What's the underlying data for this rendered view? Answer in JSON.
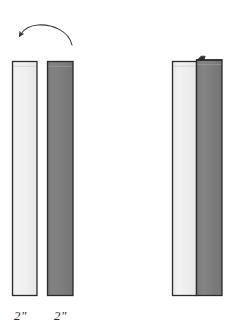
{
  "figure": {
    "background_color": "#ffffff"
  },
  "colors": {
    "light_board_fill": "#ececec",
    "light_board_fill_edge": "#f7f7f7",
    "dark_board_fill": "#7d7d7d",
    "dark_board_fill_edge": "#8a8a8a",
    "outline": "#2a2a2a",
    "arrow": "#3a3a3a",
    "label_text": "#2b2b2b"
  },
  "separated_view": {
    "name": "separated-boards",
    "light_board": {
      "name": "light-board",
      "label": "2\"",
      "fill": "#ececec"
    },
    "dark_board": {
      "name": "dark-board",
      "label": "2\"",
      "fill": "#7d7d7d"
    },
    "rotation_arrow": {
      "name": "flip-arrow",
      "direction": "counterclockwise",
      "meaning": "flip board over"
    }
  },
  "assembled_view": {
    "name": "assembled-boards",
    "light_board": {
      "name": "light-board-assembled",
      "fill": "#ececec"
    },
    "dark_board": {
      "name": "dark-board-assembled",
      "fill": "#7d7d7d"
    },
    "joint_tab": {
      "name": "joint-tab",
      "description": "small protruding tab at top of dark board"
    }
  },
  "labels": [
    {
      "text": "2\"",
      "for": "light-board"
    },
    {
      "text": "2\"",
      "for": "dark-board"
    }
  ]
}
